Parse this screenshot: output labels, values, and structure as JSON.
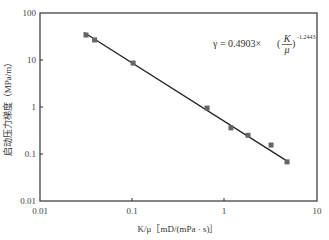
{
  "chart_data": {
    "type": "scatter",
    "title": "",
    "xlabel": "K/μ［mD/(mPa · s)］",
    "ylabel": "启动压力梯度（MPa/m）",
    "xscale": "log",
    "yscale": "log",
    "xlim": [
      0.01,
      10
    ],
    "ylim": [
      0.01,
      100
    ],
    "x_ticks": [
      "0.01",
      "0.1",
      "1",
      "10"
    ],
    "y_ticks": [
      "0.01",
      "0.1",
      "1",
      "10",
      "100"
    ],
    "grid": false,
    "legend": "none",
    "series": [
      {
        "name": "measured",
        "marker": "square",
        "x": [
          0.0315,
          0.039,
          0.102,
          0.645,
          1.17,
          1.79,
          3.18,
          4.74
        ],
        "y": [
          34,
          26.7,
          8.6,
          0.95,
          0.36,
          0.25,
          0.155,
          0.068
        ]
      },
      {
        "name": "fit",
        "type": "line",
        "equation": "γ = 0.4903×(K/μ)^-1.2443",
        "coefficient": 0.4903,
        "exponent": -1.2443,
        "x_range": [
          0.03,
          4.8
        ]
      }
    ],
    "annotation": {
      "prefix": "γ = 0.4903×",
      "frac_num": "K",
      "frac_den": "μ",
      "exponent": "-1.2443"
    },
    "colors": {
      "axis": "#333333",
      "marker": "#666666",
      "line": "#222222"
    }
  }
}
